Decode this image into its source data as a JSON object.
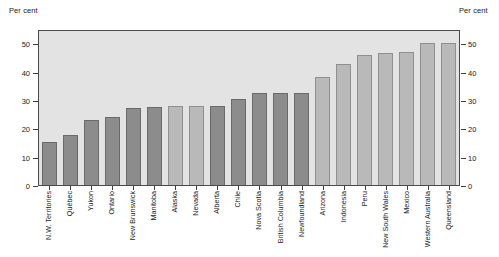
{
  "axes": {
    "left_title": "Per cent",
    "right_title": "Per cent",
    "yticks": [
      0,
      10,
      20,
      30,
      40,
      50
    ]
  },
  "chart_data": {
    "type": "bar",
    "title": "",
    "xlabel": "",
    "ylabel": "Per cent",
    "ylim": [
      0,
      55
    ],
    "grid": false,
    "legend": "none",
    "categories": [
      "N.W. Territories",
      "Québec",
      "Yukon",
      "Ontario",
      "New Brunswick",
      "Manitoba",
      "Alaska",
      "Nevada",
      "Alberta",
      "Chile",
      "Nova Scotia",
      "British Columbia",
      "Newfoundland",
      "Arizona",
      "Indonesia",
      "Peru",
      "New South Wales",
      "Mexico",
      "Western Australia",
      "Queensland"
    ],
    "values": [
      15,
      17.5,
      23,
      24,
      27,
      27.5,
      28,
      28,
      28,
      30.5,
      32.5,
      32.5,
      32.5,
      38,
      42.5,
      46,
      46.5,
      47,
      50,
      50
    ],
    "shades": [
      "dark",
      "dark",
      "dark",
      "dark",
      "dark",
      "dark",
      "light",
      "light",
      "dark",
      "dark",
      "dark",
      "dark",
      "dark",
      "light",
      "light",
      "light",
      "light",
      "light",
      "light",
      "light"
    ],
    "colors": {
      "dark_bar": "#8c8c8c",
      "light_bar": "#b9b9b9",
      "plot_background": "#e3e3e3",
      "frame": "#4a4a4a"
    }
  }
}
